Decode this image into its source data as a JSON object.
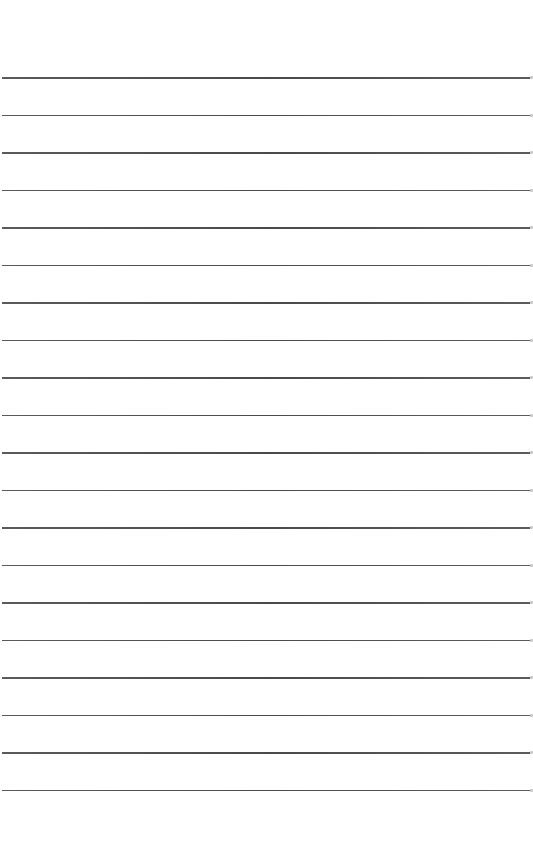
{
  "page": {
    "type": "lined-paper",
    "background": "#ffffff",
    "rule_color": "#505050",
    "rule_count": 20,
    "first_rule_y": 77,
    "rule_spacing": 37.5,
    "rule_x_start": 2,
    "rule_width": 528
  }
}
